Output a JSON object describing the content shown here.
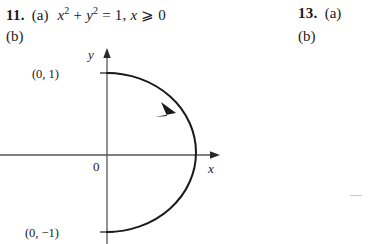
{
  "page": {
    "background_color": "#ffffff",
    "ink_color": "#1a1a1a",
    "width": 372,
    "height": 244
  },
  "entries": [
    {
      "number": "11.",
      "parts": [
        {
          "label": "(a)",
          "text": "x² + y² = 1, x ⩾ 0",
          "equation": {
            "lhs_term1_base": "x",
            "lhs_term1_exp": "2",
            "plus": "+",
            "lhs_term2_base": "y",
            "lhs_term2_exp": "2",
            "equals": "=",
            "rhs": "1,",
            "constraint_var": "x",
            "constraint_rel": "⩾",
            "constraint_val": "0"
          }
        },
        {
          "label": "(b)",
          "text": ""
        }
      ]
    },
    {
      "number": "13.",
      "parts": [
        {
          "label": "(a)",
          "text": ""
        },
        {
          "label": "(b)",
          "text": ""
        }
      ]
    }
  ],
  "graph": {
    "type": "parametric-curve",
    "description": "Right half of unit circle traced clockwise from (0,1) to (0,-1)",
    "axes": {
      "x_label": "x",
      "y_label": "y",
      "origin_label": "0"
    },
    "point_labels": [
      {
        "text": "(0, 1)",
        "x": 0,
        "y": 1
      },
      {
        "text": "(0, −1)",
        "x": 0,
        "y": -1
      }
    ],
    "direction_arrow": {
      "present": true,
      "orientation": "clockwise"
    },
    "curve": {
      "equation": "x² + y² = 1, x ⩾ 0",
      "start_point": "(0, 1)",
      "end_point": "(0, -1)"
    },
    "stray_mark": "–"
  }
}
